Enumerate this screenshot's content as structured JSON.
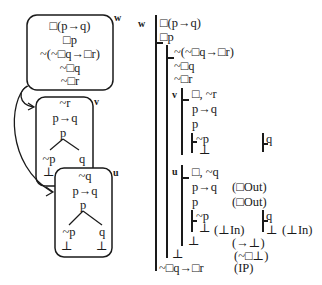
{
  "left_diagram": {
    "world_w": {
      "label": "w",
      "formulas": [
        "□(p→q)",
        "□p",
        "~(~□q→□r)",
        "~□q",
        "~□r"
      ]
    },
    "world_v": {
      "label": "v",
      "formulas": [
        "~r",
        "p→q",
        "p"
      ],
      "branches": [
        {
          "formula": "~p",
          "closed": "⊥"
        },
        {
          "formula": "q",
          "closed": ""
        }
      ]
    },
    "world_u": {
      "label": "u",
      "formulas": [
        "~q",
        "p→q",
        "p"
      ],
      "branches": [
        {
          "formula": "~p",
          "closed": "⊥"
        },
        {
          "formula": "q",
          "closed": "⊥"
        }
      ]
    },
    "arrows": [
      {
        "from": "w",
        "to": "v"
      },
      {
        "from": "w",
        "to": "u"
      }
    ]
  },
  "right_proof": {
    "world_w_label": "w",
    "lines": {
      "l1": "□(p→q)",
      "l2": "□p",
      "l3": "~(~□q→□r)",
      "l4": "~□q",
      "l5": "~□r",
      "v_label": "v",
      "v1": "□, ~r",
      "v2": "p→q",
      "v3": "p",
      "v4": "~p",
      "v5": "⊥",
      "v6": "q",
      "u_label": "u",
      "u1": "□, ~q",
      "u2": "p→q",
      "u2j": "(□Out)",
      "u3": "p",
      "u3j": "(□Out)",
      "u4": "~p",
      "u5": "⊥",
      "u5j": "(⊥In)",
      "u6": "q",
      "u7": "⊥",
      "u7j": "(⊥In)",
      "u8": "⊥",
      "u8j": "(→⊥)",
      "w9": "⊥",
      "w9j": "(~□⊥)",
      "w10": "~□q→□r",
      "w10j": "(IP)"
    }
  }
}
